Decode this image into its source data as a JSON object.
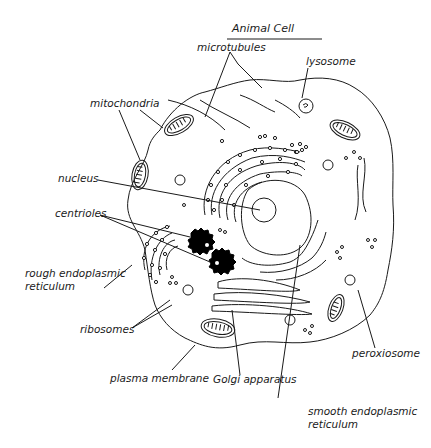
{
  "title": "Animal Cell",
  "labels": {
    "microtubules": "microtubules",
    "lysosome": "lysosome",
    "mitochondria": "mitochondria",
    "nucleus": "nucleus",
    "centrioles": "centrioles",
    "rough_er_line1": "rough endoplasmic",
    "rough_er_line2": "reticulum",
    "ribosomes": "ribosomes",
    "plasma_membrane": "plasma membrane",
    "golgi": "Golgi apparatus",
    "peroxisome": "peroxiosome",
    "smooth_er_line1": "smooth endoplasmic",
    "smooth_er_line2": "reticulum"
  },
  "colors": {
    "line": "#1a1a1a",
    "background": "#ffffff",
    "fill": "#000000"
  }
}
